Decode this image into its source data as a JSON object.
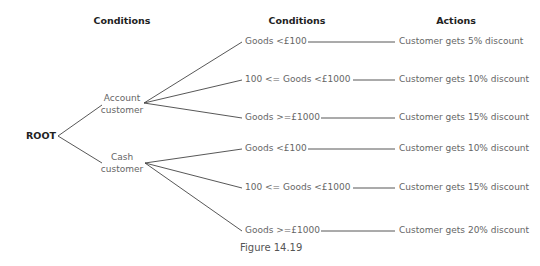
{
  "headers": {
    "conditions_1": "Conditions",
    "conditions_2": "Conditions",
    "actions": "Actions"
  },
  "root": {
    "label": "ROOT"
  },
  "branches": [
    {
      "line1": "Account",
      "line2": "customer",
      "conditions": [
        {
          "condition": "Goods <£100",
          "action": "Customer gets 5% discount"
        },
        {
          "condition": "100 <= Goods <£1000",
          "action": "Customer gets 10% discount"
        },
        {
          "condition": "Goods >=£1000",
          "action": "Customer gets 15% discount"
        }
      ]
    },
    {
      "line1": "Cash",
      "line2": "customer",
      "conditions": [
        {
          "condition": "Goods <£100",
          "action": "Customer gets 10% discount"
        },
        {
          "condition": "100 <= Goods <£1000",
          "action": "Customer gets 15% discount"
        },
        {
          "condition": "Goods >=£1000",
          "action": "Customer gets 20% discount"
        }
      ]
    }
  ],
  "caption": "Figure 14.19"
}
